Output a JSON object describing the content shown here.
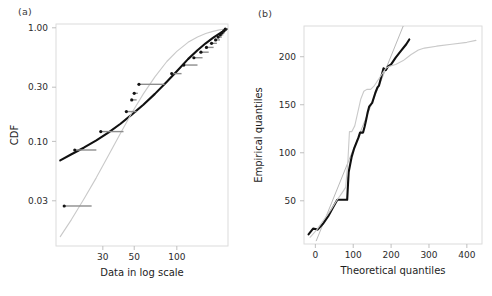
{
  "figure": {
    "width": 492,
    "height": 296,
    "background": "#ffffff"
  },
  "panels": [
    {
      "id": "a",
      "label": "(a)",
      "xlabel": "Data in log scale",
      "ylabel": "CDF"
    },
    {
      "id": "b",
      "label": "(b)",
      "xlabel": "Theoretical quantiles",
      "ylabel": "Empirical quantiles"
    }
  ],
  "colors": {
    "dark_curve": "#111111",
    "light_curve": "#c9c9c9",
    "reference_line": "#b0b0b0",
    "step_segment": "#8d8d8d",
    "step_dot": "#141414",
    "frame": "#d8d8d8",
    "tick": "#b9b9b9",
    "text": "#231f20"
  },
  "chart_data": [
    {
      "type": "line",
      "panel": "a",
      "title": "",
      "xlabel": "Data in log scale",
      "ylabel": "CDF",
      "xscale": "log",
      "yscale": "log",
      "xlim": [
        14,
        230
      ],
      "ylim": [
        0.012,
        1.08
      ],
      "xticks": [
        30,
        50,
        100
      ],
      "xtick_labels": [
        "30",
        "50",
        "100"
      ],
      "yticks": [
        0.03,
        0.1,
        0.3,
        1.0
      ],
      "ytick_labels": [
        "0.03",
        "0.10",
        "0.30",
        "1.00"
      ],
      "grid": false,
      "legend": "none",
      "series": [
        {
          "name": "fitted-dark-cdf",
          "style": "thick-black-curve",
          "x": [
            15,
            18,
            22,
            27,
            33,
            40,
            48,
            58,
            70,
            85,
            100,
            120,
            140,
            160,
            180,
            200,
            215,
            225
          ],
          "y": [
            0.068,
            0.077,
            0.088,
            0.102,
            0.12,
            0.143,
            0.172,
            0.21,
            0.262,
            0.335,
            0.415,
            0.53,
            0.635,
            0.73,
            0.815,
            0.89,
            0.94,
            0.975
          ]
        },
        {
          "name": "fitted-light-cdf",
          "style": "thin-gray-curve",
          "x": [
            15,
            18,
            22,
            27,
            33,
            40,
            48,
            58,
            70,
            85,
            100,
            120,
            140,
            160,
            180,
            200,
            215,
            225
          ],
          "y": [
            0.0145,
            0.0205,
            0.031,
            0.048,
            0.076,
            0.118,
            0.178,
            0.262,
            0.37,
            0.505,
            0.62,
            0.745,
            0.83,
            0.89,
            0.93,
            0.958,
            0.972,
            0.98
          ]
        },
        {
          "name": "empirical-step-points",
          "style": "gray-horizontal-segments-with-dark-dots",
          "points": [
            {
              "x_left": 16,
              "x_right": 25,
              "y": 0.027
            },
            {
              "x_left": 19,
              "x_right": 27,
              "y": 0.084
            },
            {
              "x_left": 29,
              "x_right": 42,
              "y": 0.122
            },
            {
              "x_left": 44,
              "x_right": 52,
              "y": 0.183
            },
            {
              "x_left": 48,
              "x_right": 52,
              "y": 0.232
            },
            {
              "x_left": 50,
              "x_right": 53,
              "y": 0.265
            },
            {
              "x_left": 54,
              "x_right": 82,
              "y": 0.318
            },
            {
              "x_left": 92,
              "x_right": 108,
              "y": 0.395
            },
            {
              "x_left": 112,
              "x_right": 140,
              "y": 0.47
            },
            {
              "x_left": 132,
              "x_right": 152,
              "y": 0.545
            },
            {
              "x_left": 148,
              "x_right": 168,
              "y": 0.61
            },
            {
              "x_left": 162,
              "x_right": 182,
              "y": 0.672
            },
            {
              "x_left": 176,
              "x_right": 192,
              "y": 0.73
            },
            {
              "x_left": 188,
              "x_right": 202,
              "y": 0.782
            },
            {
              "x_left": 196,
              "x_right": 208,
              "y": 0.828
            },
            {
              "x_left": 203,
              "x_right": 213,
              "y": 0.868
            },
            {
              "x_left": 209,
              "x_right": 218,
              "y": 0.905
            },
            {
              "x_left": 215,
              "x_right": 222,
              "y": 0.94
            },
            {
              "x_left": 220,
              "x_right": 226,
              "y": 0.972
            }
          ]
        }
      ]
    },
    {
      "type": "line",
      "panel": "b",
      "title": "",
      "xlabel": "Theoretical quantiles",
      "ylabel": "Empirical quantiles",
      "xscale": "linear",
      "yscale": "linear",
      "xlim": [
        -30,
        440
      ],
      "ylim": [
        5,
        232
      ],
      "xticks": [
        0,
        100,
        200,
        300,
        400
      ],
      "xtick_labels": [
        "0",
        "100",
        "200",
        "300",
        "400"
      ],
      "yticks": [
        50,
        100,
        150,
        200
      ],
      "ytick_labels": [
        "50",
        "100",
        "150",
        "200"
      ],
      "grid": false,
      "legend": "none",
      "series": [
        {
          "name": "qq-reference-line",
          "style": "thin-gray-straight-line",
          "x": [
            2,
            232
          ],
          "y": [
            8,
            232
          ]
        },
        {
          "name": "qq-empirical-dark",
          "style": "thick-black-step-curve",
          "x": [
            -18,
            -6,
            6,
            20,
            34,
            48,
            58,
            66,
            72,
            78,
            84,
            86,
            88,
            92,
            96,
            102,
            108,
            114,
            118,
            122,
            126,
            130,
            134,
            138,
            142,
            150,
            158,
            164,
            168,
            172,
            176,
            180,
            186,
            192,
            200,
            212,
            226,
            240,
            248
          ],
          "y": [
            15,
            21,
            20,
            26,
            34,
            44,
            51,
            51,
            51,
            51,
            51,
            66,
            80,
            88,
            96,
            104,
            110,
            116,
            121,
            121,
            121,
            127,
            134,
            142,
            148,
            152,
            162,
            168,
            170,
            176,
            182,
            188,
            186,
            190,
            192,
            199,
            206,
            213,
            218
          ]
        },
        {
          "name": "qq-model-light",
          "style": "thin-gray-step-curve",
          "x": [
            -14,
            4,
            22,
            40,
            56,
            70,
            80,
            86,
            90,
            96,
            104,
            112,
            120,
            128,
            136,
            146,
            156,
            166,
            176,
            186,
            196,
            212,
            232,
            252,
            272,
            288,
            320,
            360,
            400,
            424
          ],
          "y": [
            12,
            20,
            30,
            40,
            50,
            58,
            64,
            92,
            122,
            122,
            128,
            142,
            156,
            164,
            166,
            166,
            170,
            176,
            182,
            188,
            190,
            192,
            196,
            202,
            207,
            209,
            211,
            213,
            215,
            217
          ]
        }
      ]
    }
  ]
}
